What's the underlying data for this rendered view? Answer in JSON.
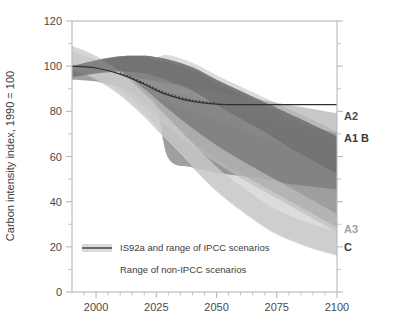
{
  "chart_data": {
    "type": "area",
    "title": "",
    "subtitle": "",
    "xlabel": "",
    "ylabel": "Carbon intensity index, 1990 = 100",
    "xlim": [
      1990,
      2100
    ],
    "ylim": [
      0,
      120
    ],
    "grid": false,
    "legend_position": "inside-bottom-left",
    "x_ticks": [
      2000,
      2025,
      2050,
      2075,
      2100
    ],
    "x_tick_labels": [
      "2000",
      "2025",
      "2050",
      "2075",
      "2100"
    ],
    "x_minor_ticks": [
      1995,
      2005,
      2010,
      2015,
      2020,
      2030,
      2035,
      2040,
      2045,
      2055,
      2060,
      2065,
      2070,
      2080,
      2085,
      2090,
      2095
    ],
    "y_ticks": [
      0,
      20,
      40,
      60,
      80,
      100,
      120
    ],
    "y_tick_labels": [
      "0",
      "20",
      "40",
      "60",
      "80",
      "100",
      "120"
    ],
    "y_minor_ticks": [
      10,
      30,
      50,
      70,
      90,
      110
    ],
    "x": [
      1990,
      2000,
      2010,
      2020,
      2025,
      2030,
      2040,
      2050,
      2060,
      2070,
      2075,
      2080,
      2090,
      2100
    ],
    "series": [
      {
        "name": "IS92a",
        "kind": "line",
        "color": "#3a3a3a",
        "values": [
          100,
          99.2,
          96.5,
          92.0,
          89.3,
          87.2,
          84.4,
          83.2,
          83.0,
          83.0,
          83.0,
          83.0,
          83.0,
          83.0
        ]
      },
      {
        "name": "IPCC scenarios envelope upper",
        "kind": "band-upper",
        "color": "#8a8a8a",
        "values": [
          100,
          102.6,
          104.4,
          104.6,
          104.0,
          103.0,
          99.5,
          94.0,
          89.0,
          84.0,
          81.5,
          79.0,
          74.0,
          69.0
        ]
      },
      {
        "name": "IPCC scenarios envelope lower",
        "kind": "band-lower",
        "color": "#8a8a8a",
        "values": [
          100,
          97.0,
          92.0,
          84.0,
          79.5,
          75.0,
          66.5,
          59.0,
          52.5,
          46.5,
          43.5,
          40.5,
          34.5,
          28.5
        ]
      },
      {
        "name": "Non-IPCC scenarios envelope upper",
        "kind": "band-upper",
        "color": "#c9c9c9",
        "values": [
          100,
          100.5,
          100.0,
          98.0,
          96.5,
          95.0,
          91.5,
          87.5,
          83.5,
          79.5,
          77.5,
          75.5,
          71.5,
          67.5
        ]
      },
      {
        "name": "Non-IPCC scenarios envelope lower",
        "kind": "band-lower",
        "color": "#c9c9c9",
        "values": [
          100,
          95.5,
          88.5,
          79.0,
          73.5,
          68.0,
          57.0,
          46.5,
          38.0,
          30.5,
          27.5,
          25.0,
          21.0,
          18.0
        ]
      }
    ],
    "annotations": [
      {
        "id": "A2",
        "text": "A2",
        "value": 78,
        "color": "#4d4d4d"
      },
      {
        "id": "A1B",
        "text": "A1 B",
        "value": 68,
        "color": "#3a3a3a"
      },
      {
        "id": "A3",
        "text": "A3",
        "value": 28,
        "color": "#a0a0a0"
      },
      {
        "id": "C",
        "text": "C",
        "value": 20,
        "color": "#3a3a3a"
      }
    ],
    "legend": [
      {
        "label": "IS92a and range of IPCC scenarios",
        "marker": "line-with-band"
      },
      {
        "label": "Range of non-IPCC scenarios",
        "marker": "none"
      }
    ]
  },
  "axes": {
    "y_title": "Carbon intensity index, 1990 = 100",
    "y_tick_labels": [
      "0",
      "20",
      "40",
      "60",
      "80",
      "100",
      "120"
    ],
    "x_tick_labels": [
      "2000",
      "2025",
      "2050",
      "2075",
      "2100"
    ]
  },
  "legend": {
    "item_1": "IS92a and range of IPCC scenarios",
    "item_2": "Range of non-IPCC scenarios"
  },
  "scenario_labels": {
    "a2": "A2",
    "a1b": "A1 B",
    "a3": "A3",
    "c": "C"
  },
  "colors": {
    "frame": "#b5b5b5",
    "main_line": "#3a3a3a",
    "ipcc_band": "#8a8a8a",
    "nonipcc_band": "#cfcfcf",
    "text": "#3c3c3c"
  }
}
